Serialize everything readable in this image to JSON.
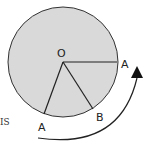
{
  "diagram": {
    "center_label": "O",
    "point_labels": {
      "a_right": "A",
      "a_bottom": "A",
      "b": "B"
    },
    "side_text": "IS",
    "colors": {
      "disc_fill": "#d9d9d9",
      "stroke": "#333333",
      "arrow": "#111111"
    }
  }
}
